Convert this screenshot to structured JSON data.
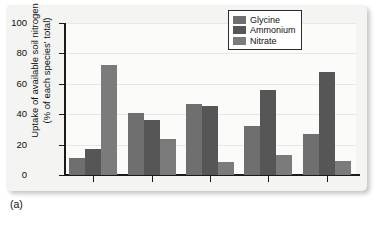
{
  "caption": "(a)",
  "chart_data": {
    "type": "bar",
    "title": "",
    "xlabel": "",
    "ylabel": "Uptake of available soil nitrogen (% of each species' total)",
    "ylabel_line1": "Uptake of available soil nitrogen",
    "ylabel_line2": "(% of each species' total)",
    "ylim": [
      0,
      100
    ],
    "yticks": [
      0,
      20,
      40,
      60,
      80,
      100
    ],
    "ytick_labels": [
      "0",
      "20",
      "40",
      "60",
      "80",
      "100"
    ],
    "grid": true,
    "grid_axis": "y",
    "legend_position": "top-right",
    "categories": [
      "1",
      "2",
      "3",
      "4",
      "5"
    ],
    "xtick_labels": [
      "",
      "",
      "",
      "",
      ""
    ],
    "series": [
      {
        "name": "Glycine",
        "color": "#6f6f6f",
        "values": [
          11,
          40.5,
          47,
          32.5,
          27
        ]
      },
      {
        "name": "Ammonium",
        "color": "#565656",
        "values": [
          17,
          36.5,
          45.5,
          56,
          68
        ]
      },
      {
        "name": "Nitrate",
        "color": "#7b7b7b",
        "values": [
          72.5,
          23.5,
          8.5,
          13,
          9
        ]
      }
    ]
  },
  "colors": {
    "panel_background": "#f4f4f3",
    "plot_background": "#fbfbfa",
    "axis": "#1a1a1a",
    "gridline": "#e7e7e6",
    "text": "#0f0f0f"
  }
}
